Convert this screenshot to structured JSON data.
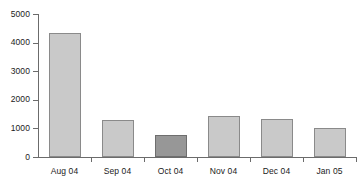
{
  "chart_data": {
    "type": "bar",
    "title": "",
    "subtitle": "",
    "xlabel": "",
    "ylabel": "",
    "categories": [
      "Aug 04",
      "Sep 04",
      "Oct 04",
      "Nov 04",
      "Dec 04",
      "Jan 05"
    ],
    "values": [
      4350,
      1290,
      770,
      1440,
      1320,
      1020
    ],
    "series": [
      {
        "name": "Monthly value",
        "values": [
          4350,
          1290,
          770,
          1440,
          1320,
          1020
        ]
      }
    ],
    "highlighted_category": "Oct 04",
    "highlighted_index": 2,
    "ylim": [
      0,
      5000
    ],
    "ytick_labels": [
      "0",
      "1000",
      "2000",
      "3000",
      "4000",
      "5000"
    ],
    "ytick_values": [
      0,
      1000,
      2000,
      3000,
      4000,
      5000
    ],
    "grid": false,
    "legend": null,
    "colors": {
      "bar_fill": "#c9c9c9",
      "bar_border": "#8a8a8a",
      "highlight_fill": "#979797",
      "highlight_border": "#6e6e6e",
      "axis": "#6b6b6b",
      "text": "#1b1b1b",
      "background": "#ffffff"
    }
  }
}
